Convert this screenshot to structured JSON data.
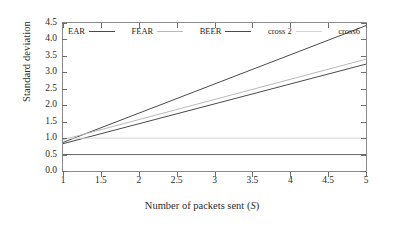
{
  "chart_data": {
    "type": "line",
    "title": "",
    "xlabel": "Number of packets sent (S)",
    "xlabel_plain": "Number of packets sent",
    "xlabel_italic_symbol": "S",
    "ylabel": "Standard deviation",
    "xlim": [
      1,
      5
    ],
    "ylim": [
      0.0,
      4.5
    ],
    "xticks": [
      "1",
      "1.5",
      "2",
      "2.5",
      "3",
      "3.5",
      "4",
      "4.5",
      "5"
    ],
    "xtick_values": [
      1,
      1.5,
      2,
      2.5,
      3,
      3.5,
      4,
      4.5,
      5
    ],
    "yticks": [
      "0.0",
      "0.5",
      "1.0",
      "1.5",
      "2.0",
      "2.5",
      "3.0",
      "3.5",
      "4.0",
      "4.5"
    ],
    "ytick_values": [
      0.0,
      0.5,
      1.0,
      1.5,
      2.0,
      2.5,
      3.0,
      3.5,
      4.0,
      4.5
    ],
    "grid": false,
    "legend_position": "top-inside",
    "series": [
      {
        "name": "EAR",
        "color": "#4a4a4a",
        "x": [
          1,
          5
        ],
        "values": [
          0.87,
          4.42
        ]
      },
      {
        "name": "FEAR",
        "color": "#b9b9b9",
        "x": [
          1,
          5
        ],
        "values": [
          0.95,
          3.4
        ]
      },
      {
        "name": "BEER",
        "color": "#4a4a4a",
        "x": [
          1,
          5
        ],
        "values": [
          0.83,
          3.25
        ]
      },
      {
        "name": "cross 2",
        "color": "#d6d6d6",
        "x": [
          1,
          5
        ],
        "values": [
          1.0,
          1.0
        ]
      },
      {
        "name": "cross6",
        "color": "#666666",
        "x": [
          1,
          5
        ],
        "values": [
          0.5,
          0.5
        ]
      }
    ]
  },
  "legend": {
    "entries": [
      {
        "label": "EAR"
      },
      {
        "label": "FEAR"
      },
      {
        "label": "BEER"
      },
      {
        "label": "cross 2"
      },
      {
        "label": "cross6"
      }
    ]
  },
  "colors": {
    "axis": "#8a8a8a",
    "tick": "#6f6f6f",
    "text": "#2b2b2b",
    "background": "#ffffff"
  }
}
